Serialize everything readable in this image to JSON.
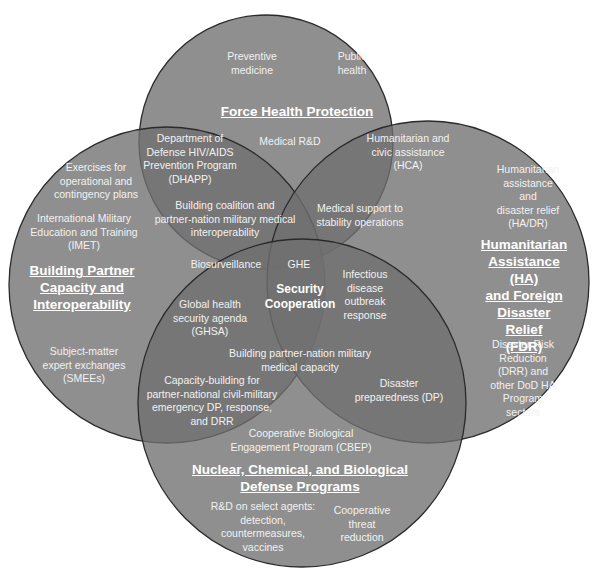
{
  "diagram": {
    "type": "venn",
    "colors": {
      "circle_fill": "#7a7a7a",
      "circle_stroke": "#2a2a2a",
      "text": "#f2f2f2",
      "background": "#ffffff"
    },
    "circles": {
      "top": {
        "title": "Force Health Protection"
      },
      "left": {
        "title": "Building Partner\nCapacity and\nInteroperability"
      },
      "right": {
        "title": "Humanitarian\nAssistance (HA)\nand Foreign\nDisaster Relief\n(FDR)"
      },
      "bottom": {
        "title": "Nuclear, Chemical, and Biological\nDefense Programs"
      }
    },
    "center_title": "Security\nCooperation",
    "labels": {
      "preventive_medicine": "Preventive\nmedicine",
      "public_health": "Public\nhealth",
      "medical_rd": "Medical R&D",
      "dhapp": "Department of\nDefense HIV/AIDS\nPrevention Program\n(DHAPP)",
      "hca": "Humanitarian and\ncivic assistance\n(HCA)",
      "exercises": "Exercises for\noperational and\ncontingency plans",
      "imet": "International Military\nEducation and Training\n(IMET)",
      "coalition": "Building coalition and\npartner-nation military medical\ninteroperability",
      "stability": "Medical support to\nstability operations",
      "hadr": "Humanitarian\nassistance and\ndisaster relief\n(HA/DR)",
      "biosurveillance": "Biosurveillance",
      "ghe": "GHE",
      "infectious": "Infectious\ndisease\noutbreak\nresponse",
      "ghsa": "Global health\nsecurity agenda\n(GHSA)",
      "smees": "Subject-matter\nexpert exchanges\n(SMEEs)",
      "capacity": "Building partner-nation military\nmedical capacity",
      "drr": "Disaster Risk\nReduction (DRR) and\nother DoD HA\nProgram sectors",
      "capacity_building": "Capacity-building for\npartner-national civil-military\nemergency DP, response,\nand DRR",
      "dp": "Disaster\npreparedness (DP)",
      "cbep": "Cooperative Biological\nEngagement Program (CBEP)",
      "rd_agents": "R&D on select agents:\ndetection,\ncountermeasures,\nvaccines",
      "ctr": "Cooperative\nthreat\nreduction"
    }
  }
}
